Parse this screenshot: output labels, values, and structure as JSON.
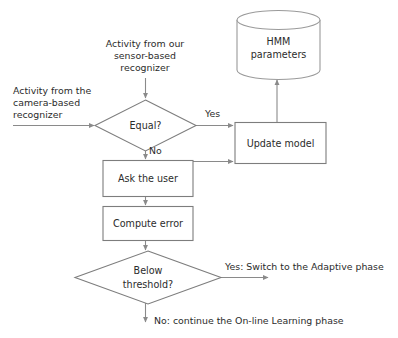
{
  "diagram": {
    "type": "flowchart",
    "colors": {
      "background": "#ffffff",
      "shape_stroke": "#7d7d7d",
      "cylinder_stroke": "#9a9a9a",
      "connector": "#8a8a8a",
      "text": "#2b2b2b"
    },
    "nodes": {
      "equal_decision": {
        "shape": "diamond",
        "label": "Equal?"
      },
      "update_model": {
        "shape": "rectangle",
        "label": "Update model"
      },
      "hmm_store": {
        "shape": "cylinder",
        "label_line1": "HMM",
        "label_line2": "parameters"
      },
      "ask_user": {
        "shape": "rectangle",
        "label": "Ask the user"
      },
      "compute_error": {
        "shape": "rectangle",
        "label": "Compute error"
      },
      "threshold_decision": {
        "shape": "diamond",
        "label_line1": "Below",
        "label_line2": "threshold?"
      }
    },
    "input_labels": {
      "sensor_input": {
        "line1": "Activity from our",
        "line2": "sensor-based",
        "line3": "recognizer"
      },
      "camera_input": {
        "line1": "Activity from the",
        "line2": "camera-based",
        "line3": "recognizer"
      }
    },
    "edge_labels": {
      "equal_yes": "Yes",
      "equal_no": "No",
      "threshold_yes": "Yes: Switch to the Adaptive phase",
      "threshold_no": "No: continue the On-line Learning phase"
    }
  }
}
